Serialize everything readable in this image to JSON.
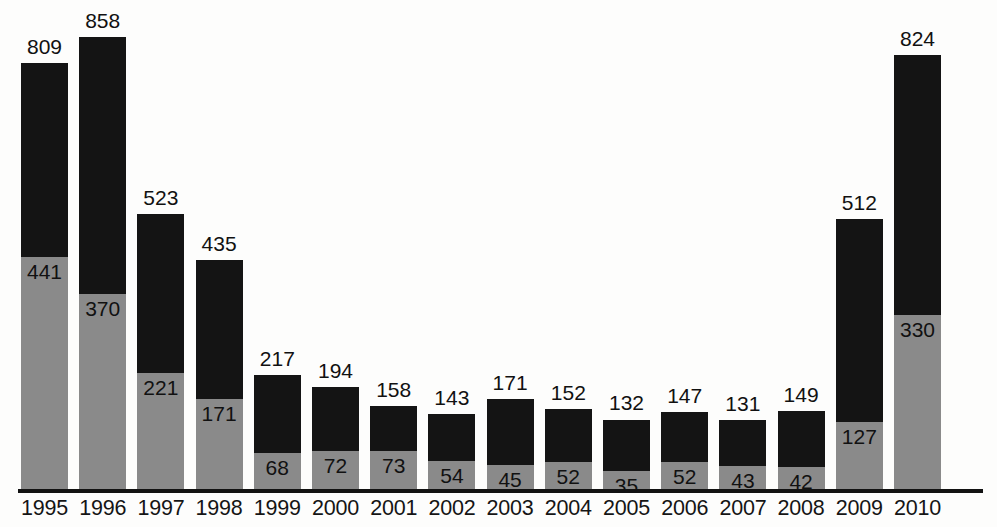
{
  "chart_data": {
    "type": "bar",
    "subtype": "stacked-vertical",
    "title": "",
    "subtitle": "",
    "xlabel": "",
    "ylabel": "",
    "grid": false,
    "legend": "none",
    "axis": {
      "y_min": 0,
      "y_max": 900,
      "y_visible": false,
      "x_axis_line": true
    },
    "categories": [
      "1995",
      "1996",
      "1997",
      "1998",
      "1999",
      "2000",
      "2001",
      "2002",
      "2003",
      "2004",
      "2005",
      "2006",
      "2007",
      "2008",
      "2009",
      "2010"
    ],
    "series": [
      {
        "name": "lower-segment",
        "color": "#8a8a8a",
        "values": [
          441,
          370,
          221,
          171,
          68,
          72,
          73,
          54,
          45,
          52,
          35,
          52,
          43,
          42,
          127,
          330
        ]
      },
      {
        "name": "upper-segment",
        "color": "#141414",
        "values": [
          368,
          488,
          302,
          264,
          149,
          122,
          85,
          89,
          126,
          100,
          97,
          95,
          88,
          107,
          385,
          494
        ]
      }
    ],
    "totals": [
      809,
      858,
      523,
      435,
      217,
      194,
      158,
      143,
      171,
      152,
      132,
      147,
      131,
      149,
      512,
      824
    ],
    "total_labels": [
      "809",
      "858",
      "523",
      "435",
      "217",
      "194",
      "158",
      "143",
      "171",
      "152",
      "132",
      "147",
      "131",
      "149",
      "512",
      "824"
    ],
    "lower_labels": [
      "441",
      "370",
      "221",
      "171",
      "68",
      "72",
      "73",
      "54",
      "45",
      "52",
      "35",
      "52",
      "43",
      "42",
      "127",
      "330"
    ],
    "colors": {
      "background": "#fdfdfc",
      "lower": "#8a8a8a",
      "upper": "#141414",
      "axis": "#121212",
      "text": "#111111"
    }
  }
}
